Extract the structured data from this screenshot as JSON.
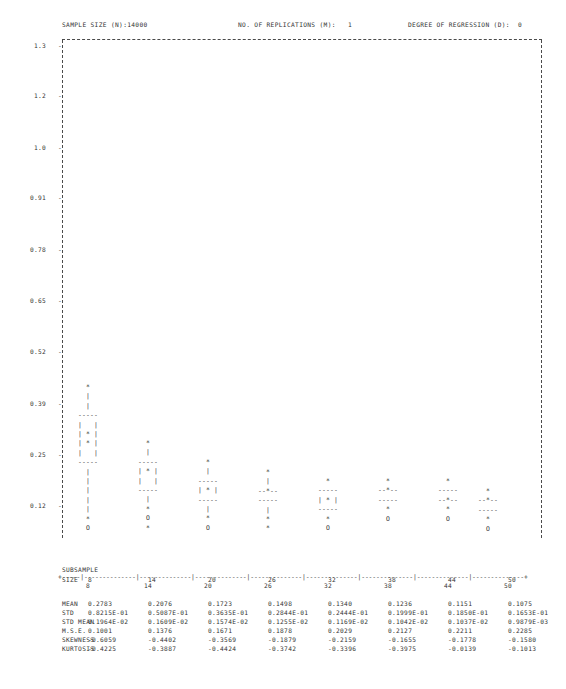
{
  "header": {
    "sample_size": "SAMPLE SIZE (N):14000",
    "replications": "NO. OF REPLICATIONS (M):   1",
    "degree": "DEGREE OF REGRESSION (D):  0"
  },
  "axes": {
    "y_ticks": [
      "1.3",
      "1.2",
      "1.0",
      "0.91",
      "0.78",
      "0.65",
      "0.52",
      "0.39",
      "0.25",
      "0.12"
    ],
    "y_tick_mark": "-",
    "x_ticks": [
      "8",
      "14",
      "20",
      "26",
      "32",
      "38",
      "44",
      "50"
    ],
    "x_axis_line": "+-----|--------------|--------------|--------------|--------------|--------------|--------------|--------------|--------------+"
  },
  "stats": {
    "subsample_word": "SUBSAMPLE",
    "size_label": "SIZE",
    "row_labels": [
      "MEAN",
      "STD",
      "STD MEAN",
      "M.S.E.",
      "SKEWNESS",
      "KURTOSIS"
    ],
    "sizes": [
      "8",
      "14",
      "20",
      "26",
      "32",
      "38",
      "44",
      "50"
    ],
    "mean": [
      "0.2783",
      "0.2076",
      "0.1723",
      "0.1498",
      "0.1340",
      "0.1236",
      "0.1151",
      "0.1075"
    ],
    "std": [
      "0.8215E-01",
      "0.5087E-01",
      "0.3635E-01",
      "0.2844E-01",
      "0.2444E-01",
      "0.1999E-01",
      "0.1850E-01",
      "0.1653E-01"
    ],
    "std_mean": [
      "0.1964E-02",
      "0.1609E-02",
      "0.1574E-02",
      "0.1255E-02",
      "0.1169E-02",
      "0.1042E-02",
      "0.1037E-02",
      "0.9879E-03"
    ],
    "mse": [
      "0.1001",
      "0.1376",
      "0.1671",
      "0.1878",
      "0.2029",
      "0.2127",
      "0.2211",
      "0.2285"
    ],
    "skewness": [
      "-0.6059",
      "-0.4402",
      "-0.3569",
      "-0.1879",
      "-0.2159",
      "-0.1655",
      "-0.1778",
      "-0.1580"
    ],
    "kurtosis": [
      "-0.4225",
      "-0.3887",
      "-0.4424",
      "-0.3742",
      "-0.3396",
      "-0.3975",
      "-0.0139",
      "-0.1013"
    ]
  },
  "chart_data": {
    "type": "box",
    "title": "",
    "xlabel": "SUBSAMPLE SIZE",
    "ylabel": "",
    "ylim": [
      0.05,
      1.36
    ],
    "grid": false,
    "legend": "none",
    "categories": [
      "8",
      "14",
      "20",
      "26",
      "32",
      "38",
      "44",
      "50"
    ],
    "series": [
      {
        "name": "box-whisker-glyphs",
        "note": "ASCII box plots: '*' outlier/whisker-cap, '|' whisker line, '---' box edge, '|*|' median line inside box, 'O' low outlier",
        "boxes": [
          {
            "size": "8",
            "upper_outlier": 0.405,
            "whisker_top": 0.38,
            "box_top": 0.33,
            "median": 0.278,
            "box_bottom": 0.245,
            "whisker_bottom": 0.15,
            "lower_outlier": 0.118
          },
          {
            "size": "14",
            "upper_outlier": 0.277,
            "whisker_top": 0.262,
            "box_top": 0.232,
            "median": 0.208,
            "box_bottom": 0.185,
            "whisker_bottom": 0.14,
            "lower_outlier": 0.112
          },
          {
            "size": "20",
            "upper_outlier": 0.235,
            "whisker_top": 0.218,
            "box_top": 0.198,
            "median": 0.172,
            "box_bottom": 0.155,
            "whisker_bottom": 0.13,
            "lower_outlier": 0.108
          },
          {
            "size": "26",
            "upper_outlier": 0.202,
            "whisker_top": 0.188,
            "box_top": 0.17,
            "median": 0.15,
            "box_bottom": 0.138,
            "whisker_bottom": 0.122,
            "lower_outlier": 0.104
          },
          {
            "size": "32",
            "upper_outlier": 0.183,
            "whisker_top": 0.17,
            "box_top": 0.155,
            "median": 0.134,
            "box_bottom": 0.126,
            "whisker_bottom": 0.116,
            "lower_outlier": 0.101
          },
          {
            "size": "38",
            "upper_outlier": 0.17,
            "whisker_top": 0.158,
            "box_top": 0.143,
            "median": 0.124,
            "box_bottom": 0.118,
            "whisker_bottom": 0.11,
            "lower_outlier": 0.099
          },
          {
            "size": "44",
            "upper_outlier": 0.16,
            "whisker_top": 0.149,
            "box_top": 0.135,
            "median": 0.115,
            "box_bottom": 0.111,
            "whisker_bottom": 0.105,
            "lower_outlier": 0.097
          },
          {
            "size": "50",
            "upper_outlier": 0.152,
            "whisker_top": 0.142,
            "box_top": 0.128,
            "median": 0.108,
            "box_bottom": 0.104,
            "whisker_bottom": 0.1,
            "lower_outlier": 0.095
          }
        ]
      }
    ],
    "glyph_columns": [
      {
        "x": "8",
        "left": 88,
        "top": 383,
        "glyphs": [
          "*",
          "|",
          "|",
          "-----",
          "|   |",
          "| * |",
          "| * |",
          "|   |",
          "-----",
          "|",
          "|",
          "|",
          "|",
          "|",
          "*",
          "O"
        ]
      },
      {
        "x": "14",
        "left": 148,
        "top": 439,
        "glyphs": [
          "*",
          "|",
          "-----",
          "| * |",
          "|   |",
          "-----",
          "|",
          "*",
          "O",
          "*"
        ]
      },
      {
        "x": "20",
        "left": 208,
        "top": 458,
        "glyphs": [
          "*",
          "|",
          "-----",
          "| * |",
          "-----",
          "|",
          "*",
          "O"
        ]
      },
      {
        "x": "26",
        "left": 268,
        "top": 468,
        "glyphs": [
          "*",
          "|",
          "--*--",
          "-----",
          "|",
          "*",
          "*"
        ]
      },
      {
        "x": "32",
        "left": 328,
        "top": 477,
        "glyphs": [
          "*",
          "-----",
          "| * |",
          "-----",
          "*",
          "O"
        ]
      },
      {
        "x": "38",
        "left": 388,
        "top": 477,
        "glyphs": [
          "*",
          "--*--",
          "-----",
          "*",
          "O"
        ]
      },
      {
        "x": "44",
        "left": 448,
        "top": 477,
        "glyphs": [
          "*",
          "-----",
          "--*--",
          "*",
          "O"
        ]
      },
      {
        "x": "50",
        "left": 488,
        "top": 487,
        "glyphs": [
          "*",
          "--*--",
          "-----",
          "*",
          "O"
        ]
      }
    ]
  }
}
